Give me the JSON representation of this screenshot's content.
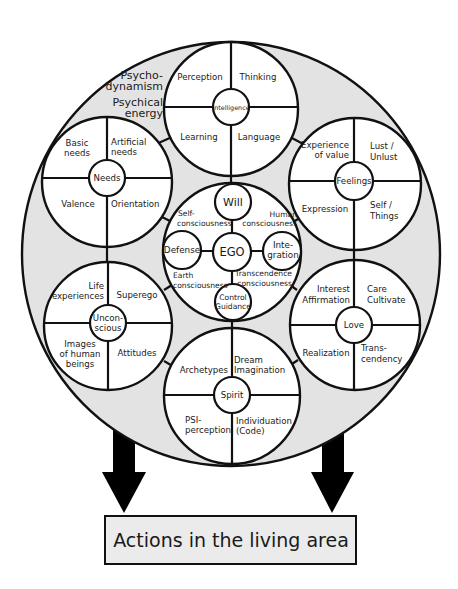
{
  "diagram": {
    "type": "psyche-model",
    "outer_circle": {
      "fill": "#e3e3e3",
      "stroke": "#111111",
      "label_lines": [
        "Psycho-",
        "dynamism",
        "Psychical",
        "energy"
      ]
    },
    "modules": [
      {
        "id": "intelligence",
        "hub": "Intelligence",
        "quadrants": {
          "top_left": [
            "Perception"
          ],
          "top_right": [
            "Thinking"
          ],
          "bottom_left": [
            "Learning"
          ],
          "bottom_right": [
            "Language"
          ]
        }
      },
      {
        "id": "needs",
        "hub": "Needs",
        "quadrants": {
          "top_left": [
            "Basic",
            "needs"
          ],
          "top_right": [
            "Artificial",
            "needs"
          ],
          "bottom_left": [
            "Valence"
          ],
          "bottom_right": [
            "Orientation"
          ]
        }
      },
      {
        "id": "feelings",
        "hub": "Feelings",
        "quadrants": {
          "top_left": [
            "Experience",
            "of value"
          ],
          "top_right": [
            "Lust /",
            "Unlust"
          ],
          "bottom_left": [
            "Expression"
          ],
          "bottom_right": [
            "Self /",
            "Things"
          ]
        }
      },
      {
        "id": "unconscious",
        "hub_lines": [
          "Uncon-",
          "scious"
        ],
        "quadrants": {
          "top_left": [
            "Life",
            "experiences"
          ],
          "top_right": [
            "Superego"
          ],
          "bottom_left": [
            "Images",
            "of human",
            "beings"
          ],
          "bottom_right": [
            "Attitudes"
          ]
        }
      },
      {
        "id": "love",
        "hub": "Love",
        "quadrants": {
          "top_left": [
            "Interest",
            "Affirmation"
          ],
          "top_right": [
            "Care",
            "Cultivate"
          ],
          "bottom_left": [
            "Realization"
          ],
          "bottom_right": [
            "Trans-",
            "cendency"
          ]
        }
      },
      {
        "id": "spirit",
        "hub": "Spirit",
        "quadrants": {
          "top_left": [
            "Archetypes"
          ],
          "top_right": [
            "Dream",
            "Imagination"
          ],
          "bottom_left": [
            "PSI-",
            "perception"
          ],
          "bottom_right": [
            "Individuation",
            "(Code)"
          ]
        }
      }
    ],
    "ego": {
      "center": "EGO",
      "nodes": {
        "top": "Will",
        "left": "Defense",
        "right_lines": [
          "Inte-",
          "gration"
        ],
        "bottom_lines": [
          "Control",
          "Guidance"
        ]
      },
      "regions": {
        "top_left": [
          "Self-",
          "consciousness"
        ],
        "top_right": [
          "Human",
          "consciousness"
        ],
        "bottom_left": [
          "Earth",
          "consciousness"
        ],
        "bottom_right": [
          "Transcendence",
          "consciousness"
        ]
      }
    },
    "output_box": {
      "label": "Actions in the living area",
      "fill": "#ebebeb"
    },
    "arrows": {
      "count": 2,
      "direction": "down",
      "color": "#000000"
    }
  }
}
